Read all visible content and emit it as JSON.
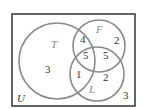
{
  "diagram": {
    "type": "venn",
    "universe_label": "U",
    "sets": [
      {
        "name": "T"
      },
      {
        "name": "F"
      },
      {
        "name": "L"
      }
    ],
    "regions": {
      "T_only": "3",
      "T_F_only": "4",
      "F_only": "2",
      "T_F_L": "5",
      "F_L_only": "5",
      "T_L_only": "1",
      "L_only": "2",
      "outside": "3"
    },
    "colors": {
      "circle": "#888888",
      "border": "#333333"
    }
  }
}
